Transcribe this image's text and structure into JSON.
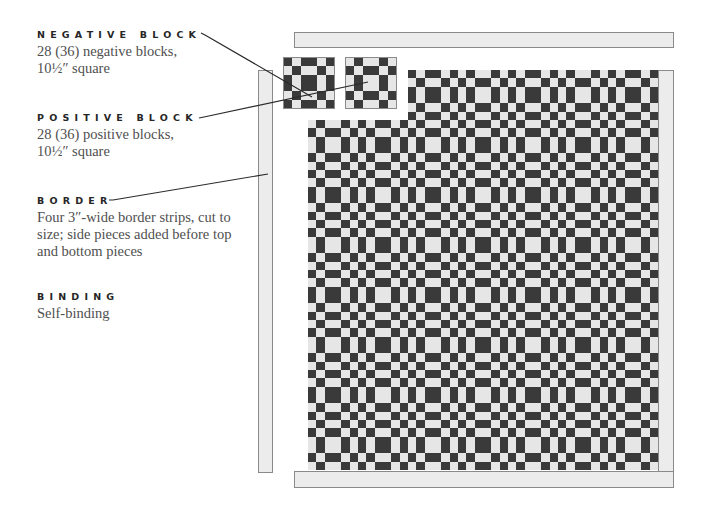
{
  "labels": [
    {
      "id": "negative-block",
      "heading": "NEGATIVE BLOCK",
      "lines": [
        "28 (36) negative blocks,",
        "10½″ square"
      ]
    },
    {
      "id": "positive-block",
      "heading": "POSITIVE BLOCK",
      "lines": [
        "28 (36) positive blocks,",
        "10½″ square"
      ]
    },
    {
      "id": "border",
      "heading": "BORDER",
      "lines": [
        "Four 3″-wide border strips, cut to",
        "size; side pieces added before top",
        "and bottom pieces"
      ]
    },
    {
      "id": "binding",
      "heading": "BINDING",
      "lines": [
        "Self-binding"
      ]
    }
  ],
  "quilt": {
    "columns": 7,
    "rows": 8,
    "block_layout": "alternating negative/positive; negative where (row+col) is even",
    "pulled_out_blocks": [
      "negative",
      "positive"
    ],
    "band_widths": [
      "narrow",
      "narrow",
      "wide",
      "narrow",
      "narrow"
    ],
    "colors": {
      "dark": "#3a3a3a",
      "light": "#e6e6e6",
      "border": "#ececec",
      "outline": "#8a8a8a"
    }
  }
}
